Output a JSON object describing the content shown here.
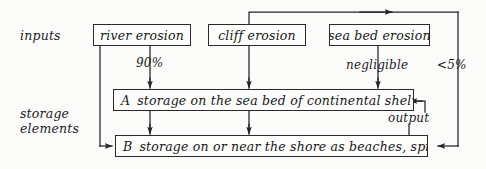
{
  "diagram": {
    "type": "flow-diagram",
    "style": "hand-drawn-italic",
    "ink_color": "#17171a",
    "paper_color": "#fbfbf9",
    "row_labels": [
      {
        "id": "inputs",
        "text": "inputs"
      },
      {
        "id": "storage-elements",
        "line1": "storage",
        "line2": "elements"
      }
    ],
    "input_boxes": [
      {
        "id": "river-erosion",
        "label": "river erosion"
      },
      {
        "id": "cliff-erosion",
        "label": "cliff erosion"
      },
      {
        "id": "sea-bed-erosion",
        "label": "sea bed erosion"
      }
    ],
    "storage_boxes": [
      {
        "id": "storage-a",
        "prefix": "A",
        "label": "storage on the sea bed of continental shelves"
      },
      {
        "id": "storage-b",
        "prefix": "B",
        "label": "storage on or near the shore as beaches, spits etc"
      }
    ],
    "flow_labels": [
      {
        "id": "river-to-a-percent",
        "text": "90%"
      },
      {
        "id": "seabed-to-a-amount",
        "text": "negligible"
      },
      {
        "id": "a-to-b-percent",
        "text": "<5%"
      },
      {
        "id": "output-label",
        "text": "output"
      }
    ]
  }
}
